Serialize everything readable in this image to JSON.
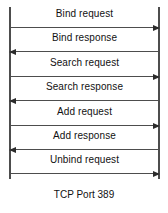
{
  "diagram": {
    "type": "sequence-diagram",
    "caption": "TCP Port 389",
    "line_color": "#4d4d4d",
    "arrow_color": "#2b2b2b",
    "background": "#ffffff",
    "lifelines": [
      {
        "name": "left-lifeline",
        "label": ""
      },
      {
        "name": "right-lifeline",
        "label": ""
      }
    ],
    "messages": [
      {
        "label": "Bind request",
        "direction": "right"
      },
      {
        "label": "Bind response",
        "direction": "left"
      },
      {
        "label": "Search request",
        "direction": "right"
      },
      {
        "label": "Search response",
        "direction": "left"
      },
      {
        "label": "Add request",
        "direction": "right"
      },
      {
        "label": "Add response",
        "direction": "left"
      },
      {
        "label": "Unbind request",
        "direction": "right"
      }
    ]
  }
}
